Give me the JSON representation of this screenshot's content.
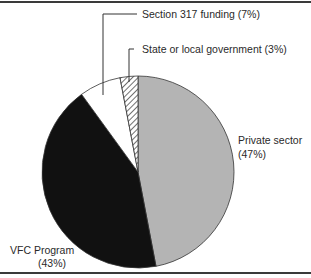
{
  "chart_data": {
    "type": "pie",
    "title": "",
    "start_angle_deg": 0,
    "direction": "clockwise",
    "slices": [
      {
        "label": "Private sector",
        "value": 47,
        "display": "(47%)",
        "fill": "#b4b4b4",
        "pattern": "solid"
      },
      {
        "label": "VFC Program",
        "value": 43,
        "display": "(43%)",
        "fill": "#111111",
        "pattern": "solid"
      },
      {
        "label": "Section 317 funding",
        "value": 7,
        "display": "(7%)",
        "fill": "#ffffff",
        "pattern": "solid"
      },
      {
        "label": "State or local government",
        "value": 3,
        "display": "(3%)",
        "fill": "#ffffff",
        "pattern": "diagonal-hatch"
      }
    ],
    "legend": "none",
    "annotations": [
      "Section 317 funding (7%)",
      "State or local government (3%)",
      "Private sector (47%)",
      "VFC Program (43%)"
    ]
  },
  "labels": {
    "section317": "Section 317 funding (7%)",
    "state_local": "State or local government (3%)",
    "private_name": "Private sector",
    "private_pct": "(47%)",
    "vfc_name": "VFC Program",
    "vfc_pct": "(43%)"
  }
}
